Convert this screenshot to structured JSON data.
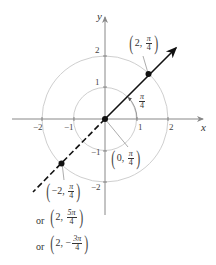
{
  "diagram": {
    "axes": {
      "x_label": "x",
      "y_label": "y",
      "x_ticks": [
        "−2",
        "−1",
        "1",
        "2"
      ],
      "y_ticks": [
        "2",
        "1",
        "−1",
        "−2"
      ]
    },
    "circles": [
      {
        "radius": 1,
        "color": "#cccccc"
      },
      {
        "radius": 2,
        "color": "#cccccc"
      }
    ],
    "angle_label": {
      "num": "π",
      "den": "4"
    },
    "points": [
      {
        "name": "point-2-pi4",
        "r": "2",
        "theta_num": "π",
        "theta_den": "4"
      },
      {
        "name": "origin",
        "r": "0",
        "theta_num": "π",
        "theta_den": "4"
      },
      {
        "name": "point-neg2-pi4",
        "r": "−2",
        "theta_num": "π",
        "theta_den": "4"
      }
    ],
    "alternates": [
      {
        "prefix": "or",
        "r": "2",
        "theta_num": "5π",
        "theta_den": "4",
        "sign": ""
      },
      {
        "prefix": "or",
        "r": "2",
        "theta_num": "3π",
        "theta_den": "4",
        "sign": "−"
      }
    ],
    "colors": {
      "axis": "#888888",
      "circle": "#cccccc",
      "line": "#111111",
      "text": "#333333"
    }
  }
}
